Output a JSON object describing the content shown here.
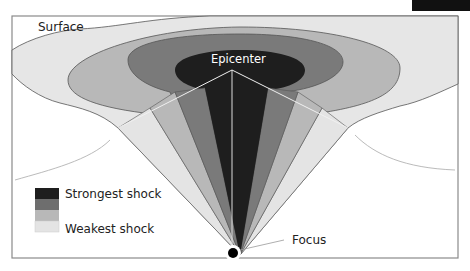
{
  "diagram": {
    "labels": {
      "surface": "Surface",
      "epicenter": "Epicenter",
      "focus": "Focus"
    },
    "legend": {
      "items": [
        {
          "label": "Strongest shock",
          "color": "#1e1e1e"
        },
        {
          "label": "",
          "color": "#6e6e6e"
        },
        {
          "label": "",
          "color": "#b8b8b8"
        },
        {
          "label": "Weakest shock",
          "color": "#e4e4e4"
        }
      ]
    },
    "colors": {
      "strongest": "#1e1e1e",
      "strong": "#6e6e6e",
      "weak": "#b8b8b8",
      "weakest": "#e4e4e4",
      "frame": "#8a8a8a",
      "background": "#ffffff"
    }
  }
}
